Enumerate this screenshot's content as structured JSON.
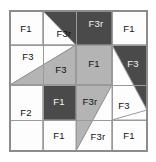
{
  "diagram": {
    "kind": "quilt-block-layout",
    "canvas": {
      "width": 156,
      "height": 162
    },
    "frame": {
      "x": 10,
      "y": 11,
      "width": 137,
      "height": 140
    },
    "grid": {
      "vertical_lines": [
        43,
        76,
        112
      ],
      "horizontal_lines": [
        45,
        85,
        120
      ]
    },
    "colors": {
      "white": "#fdfdfd",
      "light_gray": "#b4b4b4",
      "dark_gray": "#4a4a4a",
      "medium_gray": "#9a9a9a",
      "outline": "#8c8c8c",
      "label_dark": "#111111",
      "label_light": "#f2f2f2",
      "background": "#ffffff"
    },
    "fabric_legend": [
      {
        "code": "F1",
        "swatch": "#fdfdfd"
      },
      {
        "code": "F2",
        "swatch": "#fdfdfd"
      },
      {
        "code": "F3",
        "swatch": "#b4b4b4"
      },
      {
        "code": "F3r",
        "swatch": "#4a4a4a"
      }
    ],
    "patches": [
      {
        "id": "p1",
        "label": "F1",
        "fabric": "F1",
        "fill": "#fdfdfd",
        "label_on_dark": false,
        "label_x": 26,
        "label_y": 29,
        "points": "10,11 43,11 43,45 10,45"
      },
      {
        "id": "p2",
        "label": "F3r",
        "fabric": "F3r",
        "fill": "#fdfdfd",
        "label_on_dark": false,
        "label_x": 64,
        "label_y": 34,
        "points": "43,11 76,11 76,45 43,45"
      },
      {
        "id": "p3",
        "label": "F3r",
        "fabric": "F3r",
        "fill": "#4a4a4a",
        "label_on_dark": true,
        "label_x": 96,
        "label_y": 24,
        "points": "43,11 112,11 112,45 76,45"
      },
      {
        "id": "p4",
        "label": "F1",
        "fabric": "F1",
        "fill": "#fdfdfd",
        "label_on_dark": false,
        "label_x": 129,
        "label_y": 29,
        "points": "112,11 147,11 147,45 112,45"
      },
      {
        "id": "p5",
        "label": "F3",
        "fabric": "F3",
        "fill": "#fdfdfd",
        "label_on_dark": false,
        "label_x": 28,
        "label_y": 57,
        "points": "10,45 76,45 10,85"
      },
      {
        "id": "p6",
        "label": "F3",
        "fabric": "F3",
        "fill": "#b4b4b4",
        "label_on_dark": false,
        "label_x": 61,
        "label_y": 70,
        "points": "76,45 76,85 10,85"
      },
      {
        "id": "p7",
        "label": "F1",
        "fabric": "F1",
        "fill": "#b4b4b4",
        "label_on_dark": false,
        "label_x": 94,
        "label_y": 64,
        "points": "76,45 112,45 112,85 76,85"
      },
      {
        "id": "p8",
        "label": "F3",
        "fabric": "F3",
        "fill": "#4a4a4a",
        "label_on_dark": true,
        "label_x": 133,
        "label_y": 64,
        "points": "112,45 147,45 147,110 112,45"
      },
      {
        "id": "p9",
        "label": "F3",
        "fabric": "F3",
        "fill": "#fdfdfd",
        "label_on_dark": false,
        "label_x": 124,
        "label_y": 106,
        "points": "112,45 147,110 112,120"
      },
      {
        "id": "p10",
        "label": "F2",
        "fabric": "F2",
        "fill": "#fdfdfd",
        "label_on_dark": false,
        "label_x": 26,
        "label_y": 113,
        "points": "10,85 43,85 43,151 10,151"
      },
      {
        "id": "p11",
        "label": "F1",
        "fabric": "F1",
        "fill": "#4a4a4a",
        "label_on_dark": true,
        "label_x": 59,
        "label_y": 102,
        "points": "43,85 76,85 76,120 43,120"
      },
      {
        "id": "p12",
        "label": "F3r",
        "fabric": "F3r",
        "fill": "#b4b4b4",
        "label_on_dark": false,
        "label_x": 90,
        "label_y": 102,
        "points": "76,85 112,85 76,151"
      },
      {
        "id": "p13",
        "label": "F1",
        "fabric": "F1",
        "fill": "#fdfdfd",
        "label_on_dark": false,
        "label_x": 59,
        "label_y": 136,
        "points": "43,120 76,120 76,151 43,151"
      },
      {
        "id": "p14",
        "label": "F3r",
        "fabric": "F3r",
        "fill": "#fdfdfd",
        "label_on_dark": false,
        "label_x": 98,
        "label_y": 137,
        "points": "112,85 112,151 76,151"
      },
      {
        "id": "p15",
        "label": "F1",
        "fabric": "F1",
        "fill": "#fdfdfd",
        "label_on_dark": false,
        "label_x": 129,
        "label_y": 136,
        "points": "112,120 147,120 147,151 112,151"
      }
    ]
  }
}
